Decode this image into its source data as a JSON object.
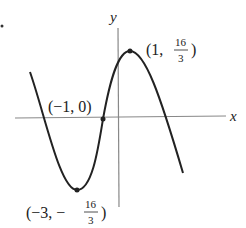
{
  "diagram": {
    "type": "function-graph",
    "axes": {
      "x_label": "x",
      "y_label": "y"
    },
    "points": [
      {
        "name": "local-max",
        "label_open": "(1, ",
        "frac_num": "16",
        "frac_den": "3",
        "label_close": ")",
        "x": 1,
        "y": "16/3"
      },
      {
        "name": "x-intercept",
        "label": "(−1, 0)",
        "x": -1,
        "y": 0
      },
      {
        "name": "local-min",
        "label_open": "(−3, −",
        "frac_num": "16",
        "frac_den": "3",
        "label_close": " )",
        "x": -3,
        "y": "-16/3"
      }
    ],
    "colors": {
      "curve": "#222222",
      "axes": "#888888",
      "text": "#222222"
    }
  }
}
